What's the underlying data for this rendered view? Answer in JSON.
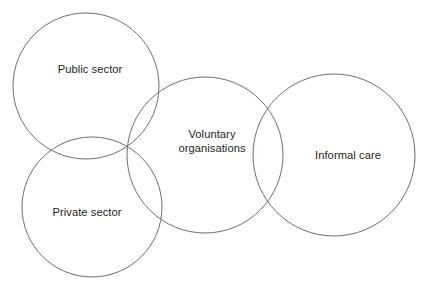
{
  "diagram": {
    "type": "venn",
    "title": "",
    "background_color": "#ffffff",
    "stroke_color": "#6e6e72",
    "text_color": "#221f20",
    "width": 428,
    "height": 293,
    "circles": [
      {
        "id": "public-sector",
        "label": "Public sector",
        "cx": 86,
        "cy": 86,
        "r": 73,
        "label_x": 90,
        "label_y": 69
      },
      {
        "id": "private-sector",
        "label": "Private sector",
        "cx": 92,
        "cy": 207,
        "r": 70,
        "label_x": 87,
        "label_y": 212
      },
      {
        "id": "voluntary-organisations",
        "label": "Voluntary\norganisations",
        "cx": 205,
        "cy": 155,
        "r": 78,
        "label_x": 212,
        "label_y": 141
      },
      {
        "id": "informal-care",
        "label": "Informal care",
        "cx": 334,
        "cy": 155,
        "r": 81,
        "label_x": 348,
        "label_y": 155
      }
    ]
  }
}
